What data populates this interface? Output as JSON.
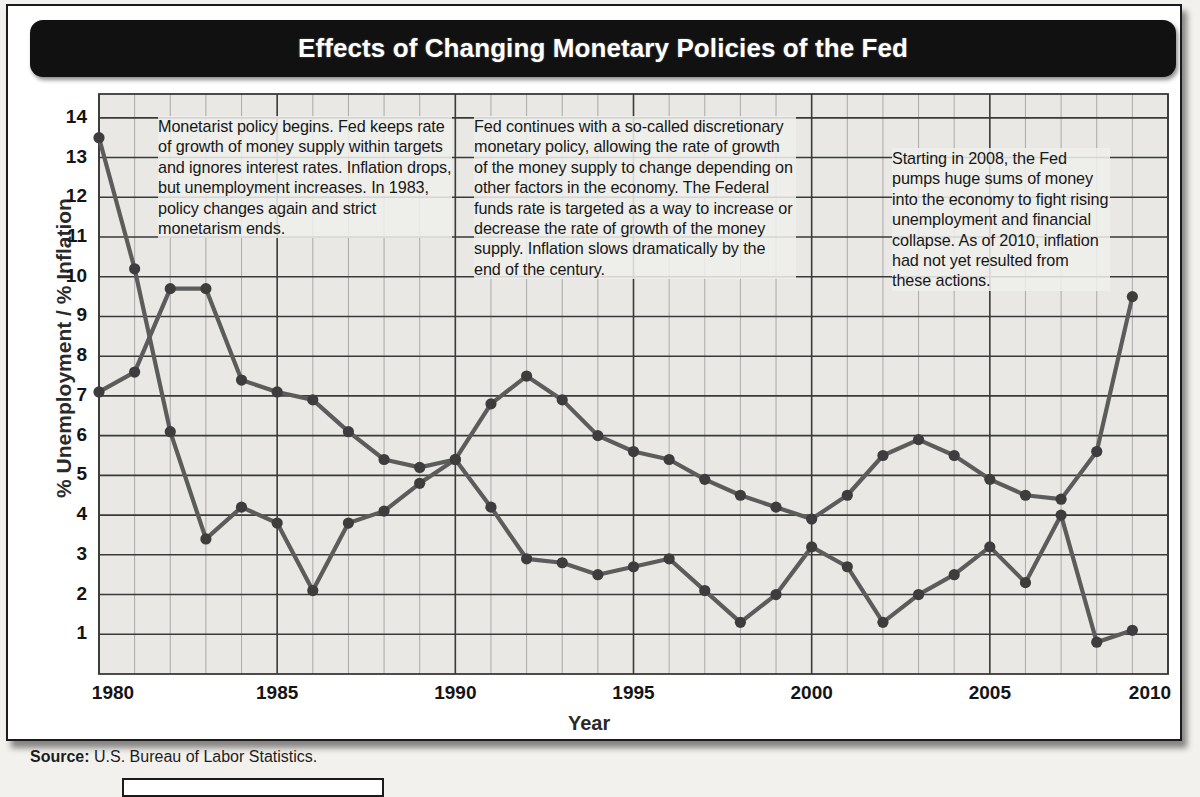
{
  "header": {
    "title": "Effects of Changing Monetary Policies of the Fed"
  },
  "source": {
    "label": "Source:",
    "text": "U.S. Bureau of Labor Statistics."
  },
  "annotations": [
    {
      "id": "note-monetarist-policy",
      "text": "Monetarist policy begins. Fed keeps rate of growth of money supply within targets and ignores interest rates. Inflation drops, but unemployment increases. In 1983, policy changes again and strict monetarism ends."
    },
    {
      "id": "note-discretionary-policy",
      "text": "Fed continues with a so-called discretionary monetary policy, allowing the rate of growth of the money supply to change depending on other factors in the economy. The Federal funds rate is targeted as a way to increase or decrease the rate of growth of the money supply. Inflation slows dramatically by the end of the century."
    },
    {
      "id": "note-2008-stimulus",
      "text": "Starting in 2008, the Fed pumps huge sums of money into the economy to fight rising unemployment and financial collapse. As of 2010, inflation had not yet resulted from these actions."
    }
  ],
  "colors": {
    "title_bar": "#111111",
    "title_text": "#ffffff",
    "plot_background": "#e9e8e4",
    "grid_major": "#3a3a3a",
    "grid_minor": "#9a9a9a",
    "series_line": "#5c5c5c",
    "series_marker": "#3d3d3d",
    "frame": "#1b1b1b"
  },
  "chart_data": {
    "type": "line",
    "title": "Effects of Changing Monetary Policies of the Fed",
    "xlabel": "Year",
    "ylabel": "% Unemployment / % Inflation",
    "xlim": [
      1980,
      2010
    ],
    "ylim": [
      0,
      14.6
    ],
    "yticks": [
      1,
      2,
      3,
      4,
      5,
      6,
      7,
      8,
      9,
      10,
      11,
      12,
      13,
      14
    ],
    "xticks": [
      1980,
      1985,
      1990,
      1995,
      2000,
      2005,
      2010
    ],
    "xtick_labels": [
      "1980",
      "1985",
      "1990",
      "1995",
      "2000",
      "2005",
      "2010"
    ],
    "x_minor_step": 1,
    "grid": true,
    "legend": "none",
    "x": [
      1980,
      1981,
      1982,
      1983,
      1984,
      1985,
      1986,
      1987,
      1988,
      1989,
      1990,
      1991,
      1992,
      1993,
      1994,
      1995,
      1996,
      1997,
      1998,
      1999,
      2000,
      2001,
      2002,
      2003,
      2004,
      2005,
      2006,
      2007,
      2008,
      2009
    ],
    "series": [
      {
        "name": "Inflation",
        "values": [
          13.5,
          10.2,
          6.1,
          3.4,
          4.2,
          3.8,
          2.1,
          3.8,
          4.1,
          4.8,
          5.4,
          4.2,
          2.9,
          2.8,
          2.5,
          2.7,
          2.9,
          2.1,
          1.3,
          2.0,
          3.2,
          2.7,
          1.3,
          2.0,
          2.5,
          3.2,
          2.3,
          4.0,
          0.8,
          1.1
        ]
      },
      {
        "name": "Unemployment",
        "values": [
          7.1,
          7.6,
          9.7,
          9.7,
          7.4,
          7.1,
          6.9,
          6.1,
          5.4,
          5.2,
          5.4,
          6.8,
          7.5,
          6.9,
          6.0,
          5.6,
          5.4,
          4.9,
          4.5,
          4.2,
          3.9,
          4.5,
          5.5,
          5.9,
          5.5,
          4.9,
          4.5,
          4.4,
          5.6,
          9.5
        ]
      }
    ]
  }
}
